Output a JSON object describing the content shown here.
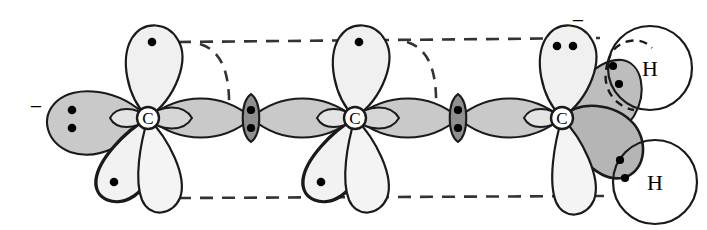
{
  "figure": {
    "type": "chemistry-orbital-diagram",
    "width": 707,
    "height": 230
  },
  "colors": {
    "background": "#ffffff",
    "outline": "#1a1a1a",
    "lobe_light": "#f0f0f0",
    "lobe_mid": "#c9c9c9",
    "lobe_dark": "#a8a8a8",
    "overlap_dark": "#8f8f8f",
    "dot": "#000000",
    "dashed": "#333333"
  },
  "atoms": [
    {
      "id": "c1",
      "label": "C",
      "kind": "carbon",
      "cx": 148,
      "cy": 118
    },
    {
      "id": "c2",
      "label": "C",
      "kind": "carbon",
      "cx": 355,
      "cy": 118
    },
    {
      "id": "c3",
      "label": "C",
      "kind": "carbon",
      "cx": 562,
      "cy": 118
    },
    {
      "id": "h1",
      "label": "H",
      "kind": "hydrogen",
      "cx": 650,
      "cy": 68
    },
    {
      "id": "h2",
      "label": "H",
      "kind": "hydrogen",
      "cx": 655,
      "cy": 182
    }
  ],
  "charges": [
    {
      "id": "minus-left",
      "symbol": "−",
      "x": 36,
      "y": 108
    },
    {
      "id": "minus-right",
      "symbol": "−",
      "x": 578,
      "y": 22
    }
  ],
  "electron_dots": {
    "c1_up_lobe": 1,
    "c1_left_lobe": 2,
    "c1_downleft_lobe": 1,
    "c2_up_lobe": 1,
    "c2_downleft_lobe": 1,
    "c3_up_lobe": 2,
    "overlap_c1_c2": 2,
    "overlap_c2_c3": 2,
    "h1_overlap": 2,
    "h2_overlap": 2
  },
  "guides": {
    "top_dashed_label": "upper reference line",
    "bottom_dashed_label": "lower reference line",
    "arc_label": "curved dashed arc"
  },
  "legend": {
    "carbon_label": "C",
    "hydrogen_label": "H",
    "minus_label": "−"
  }
}
